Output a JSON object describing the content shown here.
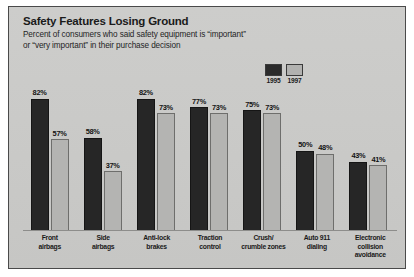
{
  "chart_data": {
    "type": "bar",
    "title": "Safety Features Losing Ground",
    "subtitle_line1": "Percent of consumers who said safety equipment is “important”",
    "subtitle_line2": "or “very important” in their purchase decision",
    "xlabel": "",
    "ylabel": "",
    "ylim": [
      0,
      100
    ],
    "grid": false,
    "legend_position": "top-right",
    "categories": [
      "Front airbags",
      "Side airbags",
      "Anti-lock brakes",
      "Traction control",
      "Crush/crumble zones",
      "Auto 911 dialing",
      "Electronic collision avoidance"
    ],
    "category_lines": [
      [
        "Front",
        "airbags"
      ],
      [
        "Side",
        "airbags"
      ],
      [
        "Anti-lock",
        "brakes"
      ],
      [
        "Traction",
        "control"
      ],
      [
        "Crush/",
        "crumble zones"
      ],
      [
        "Auto 911",
        "dialing"
      ],
      [
        "Electronic",
        "collision",
        "avoidance"
      ]
    ],
    "series": [
      {
        "name": "1995",
        "color": "#262626",
        "values": [
          82,
          58,
          82,
          77,
          75,
          50,
          43
        ],
        "labels": [
          "82%",
          "58%",
          "82%",
          "77%",
          "75%",
          "50%",
          "43%"
        ]
      },
      {
        "name": "1997",
        "color": "#b4b4b2",
        "values": [
          57,
          37,
          73,
          73,
          73,
          48,
          41
        ],
        "labels": [
          "57%",
          "37%",
          "73%",
          "73%",
          "73%",
          "48%",
          "41%"
        ]
      }
    ]
  },
  "legend": {
    "items": [
      {
        "label": "1995",
        "swatch": "dark"
      },
      {
        "label": "1997",
        "swatch": "light"
      }
    ]
  },
  "colors": {
    "plate_background": "#c9c9c7",
    "frame_border": "#4a4a4a",
    "series_1995": "#262626",
    "series_1997": "#b4b4b2",
    "text": "#1a1a1a"
  }
}
